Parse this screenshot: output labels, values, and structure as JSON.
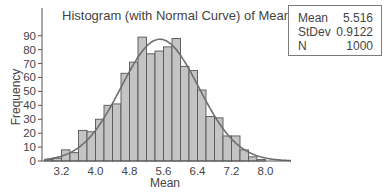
{
  "chart_data": {
    "type": "bar",
    "subtype": "histogram_with_normal_curve",
    "title": "Histogram (with Normal Curve) of Mean",
    "xlabel": "Mean",
    "ylabel": "Frequency",
    "bin_width": 0.2,
    "bin_start": 2.8,
    "bins": [
      2.8,
      3.0,
      3.2,
      3.4,
      3.6,
      3.8,
      4.0,
      4.2,
      4.4,
      4.6,
      4.8,
      5.0,
      5.2,
      5.4,
      5.6,
      5.8,
      6.0,
      6.2,
      6.4,
      6.6,
      6.8,
      7.0,
      7.2,
      7.4,
      7.6,
      7.8
    ],
    "values": [
      1,
      2,
      8,
      6,
      22,
      21,
      30,
      40,
      41,
      63,
      71,
      89,
      77,
      79,
      82,
      88,
      68,
      65,
      51,
      32,
      31,
      18,
      18,
      8,
      3,
      1
    ],
    "x_ticks": [
      "3.2",
      "4.0",
      "4.8",
      "5.6",
      "6.4",
      "7.2",
      "8.0"
    ],
    "x_tick_values": [
      3.2,
      4.0,
      4.8,
      5.6,
      6.4,
      7.2,
      8.0
    ],
    "y_ticks": [
      "0",
      "10",
      "20",
      "30",
      "40",
      "50",
      "60",
      "70",
      "80",
      "90"
    ],
    "ylim": [
      0,
      100
    ],
    "xlim": [
      2.8,
      8.6
    ],
    "normal_curve": {
      "mean": 5.516,
      "stdev": 0.9122,
      "n": 1000
    },
    "legend": "none",
    "grid": false,
    "colors": {
      "bar_fill": "#c4c4c4",
      "bar_edge": "#555555",
      "curve": "#6e6e6e",
      "axis": "#555555"
    }
  },
  "stats": [
    {
      "label": "Mean",
      "value": "5.516"
    },
    {
      "label": "StDev",
      "value": "0.9122"
    },
    {
      "label": "N",
      "value": "1000"
    }
  ]
}
